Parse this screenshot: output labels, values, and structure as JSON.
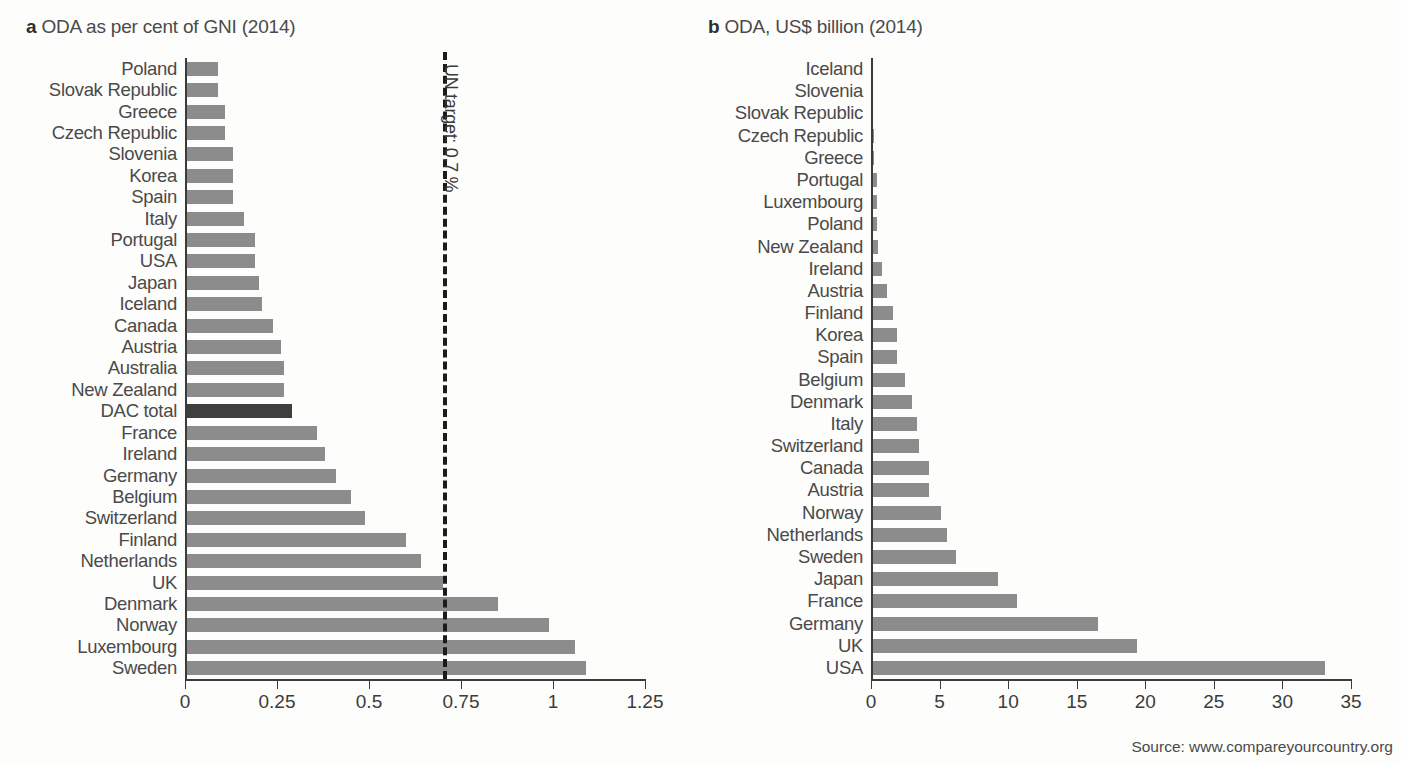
{
  "source_note": "Source: www.compareyourcountry.org",
  "panel_a": {
    "tag": "a",
    "title": "ODA as per cent of GNI (2014)",
    "target_label": "UN target: 0.7 %"
  },
  "panel_b": {
    "tag": "b",
    "title": "ODA, US$ billion (2014)"
  },
  "chart_data": [
    {
      "type": "bar",
      "orientation": "horizontal",
      "panel": "a",
      "title": "ODA as per cent of GNI (2014)",
      "xlabel": "",
      "ylabel": "",
      "xlim": [
        0,
        1.25
      ],
      "xticks": [
        0,
        0.25,
        0.5,
        0.75,
        1,
        1.25
      ],
      "xticklabels": [
        "0",
        "0.25",
        "0.5",
        "0.75",
        "1",
        "1.25"
      ],
      "grid": false,
      "legend": "none",
      "highlight_category": "DAC total",
      "annotations": [
        {
          "type": "vline",
          "value": 0.7,
          "label": "UN target: 0.7 %",
          "style": "dashed"
        }
      ],
      "categories": [
        "Poland",
        "Slovak Republic",
        "Greece",
        "Czech Republic",
        "Slovenia",
        "Korea",
        "Spain",
        "Italy",
        "Portugal",
        "USA",
        "Japan",
        "Iceland",
        "Canada",
        "Austria",
        "Australia",
        "New Zealand",
        "DAC total",
        "France",
        "Ireland",
        "Germany",
        "Belgium",
        "Switzerland",
        "Finland",
        "Netherlands",
        "UK",
        "Denmark",
        "Norway",
        "Luxembourg",
        "Sweden"
      ],
      "values": [
        0.09,
        0.09,
        0.11,
        0.11,
        0.13,
        0.13,
        0.13,
        0.16,
        0.19,
        0.19,
        0.2,
        0.21,
        0.24,
        0.26,
        0.27,
        0.27,
        0.29,
        0.36,
        0.38,
        0.41,
        0.45,
        0.49,
        0.6,
        0.64,
        0.7,
        0.85,
        0.99,
        1.06,
        1.09
      ]
    },
    {
      "type": "bar",
      "orientation": "horizontal",
      "panel": "b",
      "title": "ODA, US$ billion (2014)",
      "xlabel": "",
      "ylabel": "",
      "xlim": [
        0,
        35
      ],
      "xticks": [
        0,
        5,
        10,
        15,
        20,
        25,
        30,
        35
      ],
      "xticklabels": [
        "0",
        "5",
        "10",
        "15",
        "20",
        "25",
        "30",
        "35"
      ],
      "grid": false,
      "legend": "none",
      "categories": [
        "Iceland",
        "Slovenia",
        "Slovak Republic",
        "Czech Republic",
        "Greece",
        "Portugal",
        "Luxembourg",
        "Poland",
        "New Zealand",
        "Ireland",
        "Austria",
        "Finland",
        "Korea",
        "Spain",
        "Belgium",
        "Denmark",
        "Italy",
        "Switzerland",
        "Canada",
        "Austria",
        "Norway",
        "Netherlands",
        "Sweden",
        "Japan",
        "France",
        "Germany",
        "UK",
        "USA"
      ],
      "values": [
        0.04,
        0.06,
        0.08,
        0.21,
        0.25,
        0.43,
        0.43,
        0.45,
        0.51,
        0.81,
        1.14,
        1.63,
        1.86,
        1.89,
        2.45,
        3.0,
        3.34,
        3.52,
        4.24,
        4.26,
        5.09,
        5.57,
        6.23,
        9.27,
        10.62,
        16.57,
        19.39,
        33.1
      ]
    }
  ]
}
